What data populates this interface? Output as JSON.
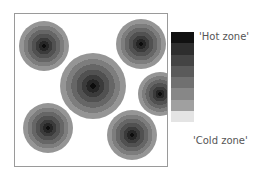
{
  "legend": {
    "hot_label": "'Hot zone'",
    "cold_label": "'Cold zone'",
    "steps": [
      "#111111",
      "#2e2e2e",
      "#444444",
      "#5a5a5a",
      "#707070",
      "#878787",
      "#a0a0a0",
      "#e4e4e4"
    ]
  },
  "zones": [
    {
      "cx": 43,
      "cy": 45,
      "r": 25
    },
    {
      "cx": 140,
      "cy": 43,
      "r": 25
    },
    {
      "cx": 92,
      "cy": 85,
      "r": 33
    },
    {
      "cx": 159,
      "cy": 93,
      "r": 22
    },
    {
      "cx": 47,
      "cy": 127,
      "r": 25
    },
    {
      "cx": 131,
      "cy": 134,
      "r": 25
    }
  ]
}
